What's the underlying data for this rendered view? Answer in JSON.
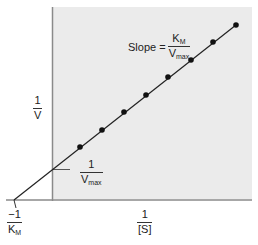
{
  "chart_data": {
    "type": "line",
    "xlabel": "1/[S]",
    "ylabel": "1/V",
    "x_intercept_label": "-1/K_M",
    "y_intercept_label": "1/V_max",
    "slope_label": "Slope = K_M / V_max",
    "grid": false,
    "legend": null,
    "line": {
      "x_intercept_px": [
        14,
        200
      ],
      "y_intercept_px": [
        52,
        170
      ],
      "end_px": [
        236,
        25
      ]
    },
    "points_px": [
      [
        80,
        147
      ],
      [
        102,
        130
      ],
      [
        124,
        112
      ],
      [
        146,
        95
      ],
      [
        168,
        77
      ],
      [
        191,
        60
      ],
      [
        213,
        42
      ],
      [
        236,
        25
      ]
    ],
    "points_count": 8,
    "shaded_region": "first quadrant (x > 0, y > 0)"
  },
  "labels": {
    "y_axis": {
      "num": "1",
      "den": "V"
    },
    "x_axis": {
      "num": "1",
      "den": "[S]"
    },
    "x_intercept": {
      "num": "−1",
      "den_main": "K",
      "den_sub": "M"
    },
    "y_intercept": {
      "num": "1",
      "den_main": "V",
      "den_sub": "max"
    },
    "slope": {
      "prefix": "Slope =",
      "num_main": "K",
      "num_sub": "M",
      "den_main": "V",
      "den_sub": "max"
    }
  },
  "colors": {
    "shade": "#ebebeb",
    "axis": "#888888",
    "line": "#222222",
    "point": "#111111"
  }
}
